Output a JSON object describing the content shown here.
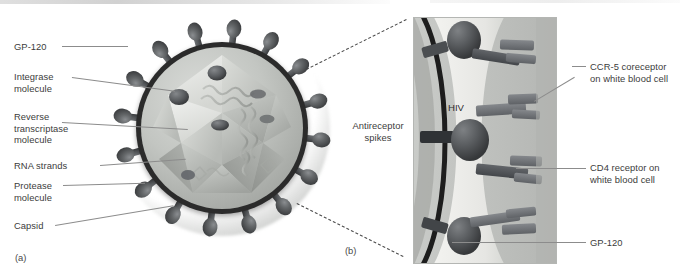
{
  "figure": {
    "title_left_tag": "(a)",
    "title_right_tag": "(b)",
    "type": "scientific-illustration"
  },
  "panel_a": {
    "tag": "(a)",
    "labels": [
      {
        "id": "gp120",
        "text": "GP-120"
      },
      {
        "id": "integrase",
        "text": "Integrase\nmolecule"
      },
      {
        "id": "rt",
        "text": "Reverse\ntranscriptase\nmolecule"
      },
      {
        "id": "rna",
        "text": "RNA strands"
      },
      {
        "id": "protease",
        "text": "Protease\nmolecule"
      },
      {
        "id": "capsid",
        "text": "Capsid"
      }
    ],
    "structures": {
      "spike_count": 16,
      "capsid_shape": "icosahedral",
      "envelope_color": "#2b2b2b",
      "matrix_color": "#c3c6c2",
      "spike_color": "#5d5f61",
      "halo_color": "#989b98"
    }
  },
  "panel_b": {
    "tag": "(b)",
    "inner_label": "HIV",
    "labels_left": [
      {
        "id": "antireceptor",
        "text": "Antireceptor\nspikes"
      }
    ],
    "labels_right": [
      {
        "id": "ccr5",
        "text": "CCR-5 coreceptor\non white blood cell"
      },
      {
        "id": "cd4",
        "text": "CD4 receptor on\nwhite blood cell"
      },
      {
        "id": "gp120",
        "text": "GP-120"
      }
    ],
    "structures": {
      "spike_count": 3,
      "receptor_count": 4,
      "cell_region_color": "#b9bbb8",
      "membrane_color": "#ededea",
      "envelope_arc_color": "#1f1f1f",
      "receptor_color": "#6f7276"
    }
  },
  "style": {
    "text_color": "#3c3c3c",
    "leader_color": "#8c8c8c",
    "dash_color": "#4a4a4a",
    "background": "#ffffff"
  }
}
